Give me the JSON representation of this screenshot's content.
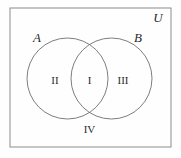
{
  "diagram": {
    "type": "venn-two-set",
    "background_color": "#fefefe",
    "stroke_color": "#8c8c8c",
    "text_color": "#2b2b2b",
    "universe": {
      "label": "U",
      "rect": {
        "x": 10,
        "y": 8,
        "width": 161,
        "height": 139
      },
      "label_position": {
        "x": 158,
        "y": 22
      }
    },
    "sets": [
      {
        "id": "A",
        "label": "A",
        "circle": {
          "cx": 67.5,
          "cy": 78.5,
          "r": 40.5
        },
        "label_position": {
          "x": 37,
          "y": 42
        }
      },
      {
        "id": "B",
        "label": "B",
        "circle": {
          "cx": 111.5,
          "cy": 78.5,
          "r": 40.5
        },
        "label_position": {
          "x": 138,
          "y": 42
        }
      }
    ],
    "regions": [
      {
        "id": "region-2",
        "label": "II",
        "meaning": "A only",
        "position": {
          "x": 55,
          "y": 84
        }
      },
      {
        "id": "region-1",
        "label": "I",
        "meaning": "A intersect B",
        "position": {
          "x": 89.5,
          "y": 84
        }
      },
      {
        "id": "region-3",
        "label": "III",
        "meaning": "B only",
        "position": {
          "x": 123,
          "y": 84
        }
      },
      {
        "id": "region-4",
        "label": "IV",
        "meaning": "outside A and B",
        "position": {
          "x": 89.5,
          "y": 133
        }
      }
    ]
  }
}
